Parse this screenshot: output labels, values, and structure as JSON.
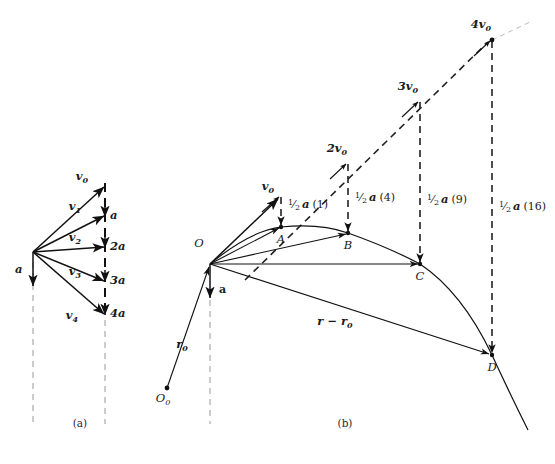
{
  "figure": {
    "title_caption_a": "(a)",
    "title_caption_b": "(b)",
    "colors": {
      "ink": "#111111",
      "dash_light": "#999999",
      "dash_faint": "#bbbbbb",
      "background": "#ffffff"
    }
  },
  "panel_a": {
    "caption": "(a)",
    "origin": {
      "x": 33,
      "y": 252
    },
    "dashed_axis_x": 105,
    "left_dashed_axis_x": 33,
    "accel_label": "a",
    "velocity_labels": [
      {
        "name": "v0",
        "base": "v",
        "sub": "0",
        "tip_x": 105,
        "tip_y": 186
      },
      {
        "name": "v1",
        "base": "v",
        "sub": "1",
        "tip_x": 105,
        "tip_y": 215
      },
      {
        "name": "v2",
        "base": "v",
        "sub": "2",
        "tip_x": 105,
        "tip_y": 246
      },
      {
        "name": "v3",
        "base": "v",
        "sub": "3",
        "tip_x": 105,
        "tip_y": 280
      },
      {
        "name": "v4",
        "base": "v",
        "sub": "4",
        "tip_x": 105,
        "tip_y": 313
      }
    ],
    "accel_increments": [
      {
        "label": "a",
        "x": 110,
        "y": 218
      },
      {
        "label": "2a",
        "x": 110,
        "y": 249
      },
      {
        "label": "3a",
        "x": 110,
        "y": 283
      },
      {
        "label": "4a",
        "x": 110,
        "y": 316
      }
    ]
  },
  "panel_b": {
    "caption": "(b)",
    "origin_label": "O",
    "origin_sub_label": "O",
    "origin_sub_index": "0",
    "origin": {
      "x": 210,
      "y": 264
    },
    "origin0": {
      "x": 167,
      "y": 388
    },
    "accel_label": "a",
    "r0_label": "r",
    "r0_sub": "0",
    "r_minus_r0_label": "r − r",
    "r_minus_r0_sub": "0",
    "velocity_tips": [
      {
        "label": "v",
        "sub": "0",
        "multiplier": 1,
        "x": 281,
        "y": 196
      },
      {
        "label": "2v",
        "sub": "0",
        "multiplier": 2,
        "x": 348,
        "y": 163
      },
      {
        "label": "3v",
        "sub": "0",
        "multiplier": 3,
        "x": 420,
        "y": 101
      },
      {
        "label": "4v",
        "sub": "0",
        "multiplier": 4,
        "x": 492,
        "y": 40
      }
    ],
    "trajectory_points": [
      {
        "label": "A",
        "x": 281,
        "y": 227
      },
      {
        "label": "B",
        "x": 348,
        "y": 233
      },
      {
        "label": "C",
        "x": 420,
        "y": 264
      },
      {
        "label": "D",
        "x": 492,
        "y": 355
      }
    ],
    "drop_labels": [
      {
        "prefix": "1/2",
        "vec": "a",
        "coeff": "(1)",
        "num": "1",
        "den": "2",
        "x": 290,
        "y": 205
      },
      {
        "prefix": "1/2",
        "vec": "a",
        "coeff": "(4)",
        "num": "1",
        "den": "2",
        "x": 357,
        "y": 198
      },
      {
        "prefix": "1/2",
        "vec": "a",
        "coeff": "(9)",
        "num": "1",
        "den": "2",
        "x": 429,
        "y": 200
      },
      {
        "prefix": "1/2",
        "vec": "a",
        "coeff": "(16)",
        "num": "1",
        "den": "2",
        "x": 501,
        "y": 207
      }
    ]
  }
}
